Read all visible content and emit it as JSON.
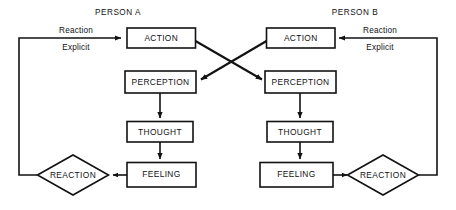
{
  "diagram": {
    "title_left": "PERSON A",
    "title_right": "PERSON B",
    "person_a": {
      "action": "ACTION",
      "perception": "PERCEPTION",
      "thought": "THOUGHT",
      "feeling": "FEELING",
      "reaction": "REACTION",
      "edge_label_top": "Reaction",
      "edge_label_bottom": "Explicit"
    },
    "person_b": {
      "action": "ACTION",
      "perception": "PERCEPTION",
      "thought": "THOUGHT",
      "feeling": "FEELING",
      "reaction": "REACTION",
      "edge_label_top": "Reaction",
      "edge_label_bottom": "Explicit"
    },
    "colors": {
      "line": "#121212",
      "fill": "#ffffff",
      "background": "#ffffff"
    }
  }
}
